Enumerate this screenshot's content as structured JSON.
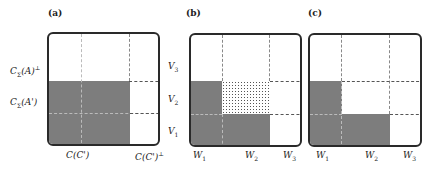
{
  "panels": {
    "a": {
      "label": "(a)",
      "y_labels": [
        "C_Σ(A)⊥",
        "C_Σ(A')"
      ],
      "x_labels": [
        "C(C')",
        "C(C')⊥"
      ],
      "y_label_parts": [
        {
          "base": "C",
          "sub": "Σ",
          "arg": "(A)",
          "sup": "⊥"
        },
        {
          "base": "C",
          "sub": "Σ",
          "arg": "(A')",
          "sup": ""
        }
      ],
      "x_label_parts": [
        {
          "base": "C",
          "arg": "(C')",
          "sup": ""
        },
        {
          "base": "C",
          "arg": "(C')",
          "sup": "⊥"
        }
      ]
    },
    "b": {
      "label": "(b)",
      "y_labels": [
        "V3",
        "V2",
        "V1"
      ],
      "y_label_parts": [
        {
          "base": "V",
          "sub": "3"
        },
        {
          "base": "V",
          "sub": "2"
        },
        {
          "base": "V",
          "sub": "1"
        }
      ],
      "x_labels": [
        "W1",
        "W2",
        "W3"
      ],
      "x_label_parts": [
        {
          "base": "W",
          "sub": "1"
        },
        {
          "base": "W",
          "sub": "2"
        },
        {
          "base": "W",
          "sub": "3"
        }
      ]
    },
    "c": {
      "label": "(c)",
      "x_labels": [
        "W1",
        "W2",
        "W3"
      ],
      "x_label_parts": [
        {
          "base": "W",
          "sub": "1"
        },
        {
          "base": "W",
          "sub": "2"
        },
        {
          "base": "W",
          "sub": "3"
        }
      ]
    }
  },
  "colors": {
    "fill": "#7d7d7d",
    "border": "#2a2a2a",
    "dots": "#555555"
  }
}
